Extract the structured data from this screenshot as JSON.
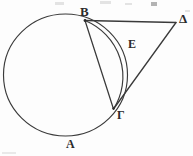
{
  "figure": {
    "type": "geometry-diagram",
    "width": 193,
    "height": 156,
    "background_color": "#fdfdfd",
    "stroke_color": "#333333",
    "label_color": "#2b2b2b"
  },
  "labels": {
    "A": "A",
    "B": "B",
    "Gamma": "Γ",
    "Delta": "Δ",
    "E": "E"
  },
  "points": {
    "A": {
      "name": "A",
      "x": 72,
      "y": 137,
      "role": "arc-label-point"
    },
    "B": {
      "name": "B",
      "x": 85,
      "y": 20,
      "role": "tangent-point"
    },
    "Gamma": {
      "name": "Γ",
      "x": 114,
      "y": 108,
      "role": "circle-point"
    },
    "Delta": {
      "name": "Δ",
      "x": 175,
      "y": 21,
      "role": "external-vertex"
    },
    "E": {
      "name": "E",
      "x": 132,
      "y": 45,
      "role": "arc-label-point"
    }
  },
  "circle": {
    "center_x": 65.5,
    "center_y": 75,
    "radius": 61.5
  },
  "segments": [
    {
      "name": "B-Delta",
      "from": "B",
      "to": "Δ",
      "kind": "tangent"
    },
    {
      "name": "Delta-Gamma",
      "from": "Δ",
      "to": "Γ",
      "kind": "secant-to-point"
    },
    {
      "name": "B-Gamma",
      "from": "B",
      "to": "Γ",
      "kind": "chord"
    }
  ],
  "arcs": [
    {
      "name": "arc-B-E-Gamma",
      "from": "B",
      "through": "E",
      "to": "Γ"
    },
    {
      "name": "arc-B-A-Gamma",
      "from": "B",
      "through": "A",
      "to": "Γ"
    }
  ]
}
